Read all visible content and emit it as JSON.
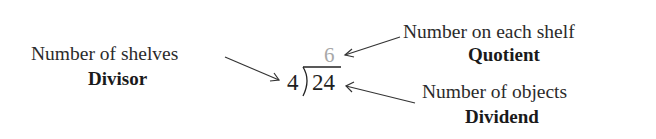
{
  "diagram": {
    "divisor_label": {
      "description": "Number of shelves",
      "term": "Divisor"
    },
    "quotient_label": {
      "description": "Number on each shelf",
      "term": "Quotient"
    },
    "dividend_label": {
      "description": "Number of objects",
      "term": "Dividend"
    },
    "division": {
      "divisor": "4",
      "dividend": "24",
      "quotient": "6"
    },
    "colors": {
      "text": "#222222",
      "quotient": "#a8a8a8",
      "arrow": "#333333"
    }
  }
}
